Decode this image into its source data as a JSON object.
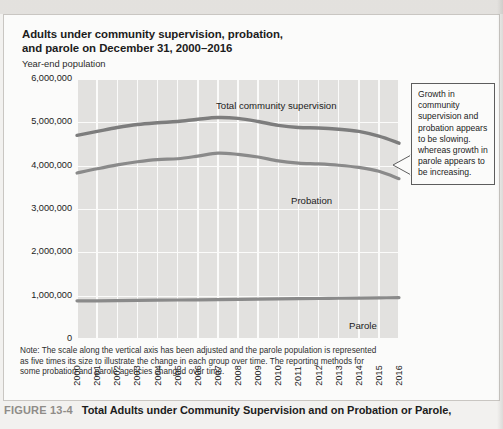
{
  "figure": {
    "number_label": "FIGURE 13-4",
    "caption": "Total Adults under Community Supervision and on Probation or Parole,"
  },
  "chart_title_line1": "Adults under community supervision, probation,",
  "chart_title_line2": "and parole on December 31, 2000–2016",
  "axis_note": "Year-end population",
  "callout": {
    "text": "Growth in community supervision and probation appears to be slowing. whereas growth in parole appears to be increasing."
  },
  "note": {
    "line1": "Note: The scale along the vertical axis has been adjusted and the parole population is represented",
    "line2": "as five times its size to illustrate the change in each group over time. The reporting methods for",
    "line3": "some probation and parole agencies changed over time."
  },
  "colors": {
    "plot_background": "#e2e1df",
    "gridline": "#fbfbfa",
    "line_total": "#7d7d7d",
    "line_probation": "#8a8a8a",
    "line_parole": "#8a8a8a",
    "panel_background": "#fbfbfa",
    "caption_number": "#8f8c88"
  },
  "chart_data": {
    "type": "line",
    "title": "Adults under community supervision, probation, and parole on December 31, 2000–2016",
    "xlabel": "",
    "ylabel": "Year-end population",
    "ylim": [
      0,
      6000000
    ],
    "yticks": [
      0,
      1000000,
      2000000,
      3000000,
      4000000,
      5000000,
      6000000
    ],
    "ytick_labels": [
      "0",
      "1,000,000",
      "2,000,000",
      "3,000,000",
      "4,000,000",
      "5,000,000",
      "6,000,000"
    ],
    "grid": true,
    "legend": "inline-labels",
    "x": [
      2000,
      2001,
      2002,
      2003,
      2004,
      2005,
      2006,
      2007,
      2008,
      2009,
      2010,
      2011,
      2012,
      2013,
      2014,
      2015,
      2016
    ],
    "xtick_labels": [
      "2000",
      "2001",
      "2002",
      "2003",
      "2004",
      "2005",
      "2006",
      "2007",
      "2008",
      "2009",
      "2010",
      "2011",
      "2012",
      "2013",
      "2014",
      "2015",
      "2016"
    ],
    "series": [
      {
        "name": "Total community supervision",
        "values": [
          4700000,
          4790000,
          4880000,
          4950000,
          4990000,
          5020000,
          5070000,
          5110000,
          5090000,
          5020000,
          4930000,
          4880000,
          4870000,
          4840000,
          4790000,
          4680000,
          4520000
        ]
      },
      {
        "name": "Probation",
        "values": [
          3830000,
          3930000,
          4020000,
          4090000,
          4140000,
          4160000,
          4220000,
          4290000,
          4260000,
          4200000,
          4110000,
          4060000,
          4040000,
          4010000,
          3960000,
          3870000,
          3700000
        ]
      },
      {
        "name": "Parole",
        "values": [
          880000,
          880000,
          885000,
          890000,
          895000,
          900000,
          905000,
          910000,
          915000,
          920000,
          925000,
          930000,
          935000,
          940000,
          945000,
          950000,
          955000
        ]
      }
    ]
  }
}
